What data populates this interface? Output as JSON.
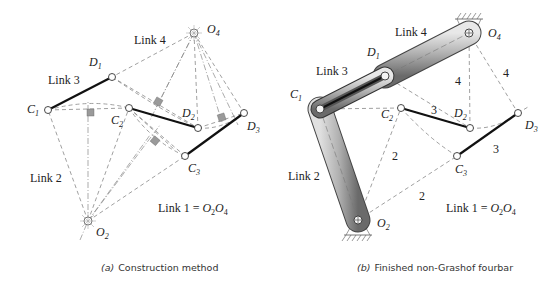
{
  "panels": [
    {
      "id": "a",
      "caption_letter": "(a)",
      "caption_text": "Construction method",
      "link_labels": {
        "link4": "Link 4",
        "link3": "Link 3",
        "link2": "Link 2",
        "link1": "Link 1 = ",
        "link1_eq": "O",
        "o2_sub": "2",
        "o4_sub": "4"
      },
      "points": {
        "O4": {
          "name": "O",
          "sub": "4"
        },
        "D1": {
          "name": "D",
          "sub": "1"
        },
        "C1": {
          "name": "C",
          "sub": "1"
        },
        "C2": {
          "name": "C",
          "sub": "2"
        },
        "D2": {
          "name": "D",
          "sub": "2"
        },
        "D3": {
          "name": "D",
          "sub": "3"
        },
        "C3": {
          "name": "C",
          "sub": "3"
        },
        "O2": {
          "name": "O",
          "sub": "2"
        }
      }
    },
    {
      "id": "b",
      "caption_letter": "(b)",
      "caption_text": "Finished non-Grashof fourbar",
      "link_labels": {
        "link4": "Link 4",
        "link3": "Link 3",
        "link2": "Link 2",
        "link1": "Link 1 = ",
        "link1_eq": "O",
        "o2_sub": "2",
        "o4_sub": "4"
      },
      "segment_labels": {
        "four_a": "4",
        "four_b": "4",
        "three_a": "3",
        "three_b": "3",
        "two_a": "2",
        "two_b": "2"
      },
      "points": {
        "O4": {
          "name": "O",
          "sub": "4"
        },
        "D1": {
          "name": "D",
          "sub": "1"
        },
        "C1": {
          "name": "C",
          "sub": "1"
        },
        "C2": {
          "name": "C",
          "sub": "2"
        },
        "D2": {
          "name": "D",
          "sub": "2"
        },
        "D3": {
          "name": "D",
          "sub": "3"
        },
        "C3": {
          "name": "C",
          "sub": "3"
        },
        "O2": {
          "name": "O",
          "sub": "2"
        }
      }
    }
  ]
}
